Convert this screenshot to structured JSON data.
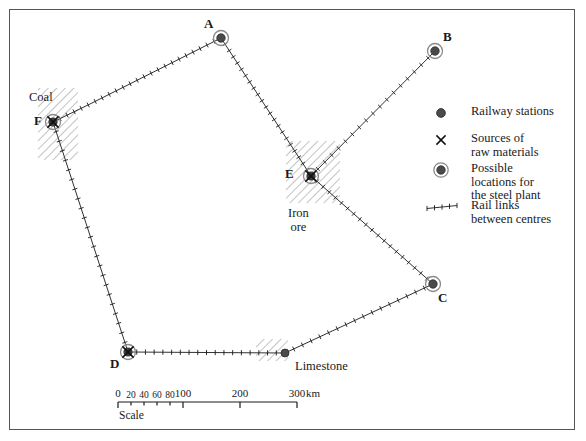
{
  "map": {
    "title": "Railway network map with raw material sources and possible steel plant locations",
    "background_color": "#ffffff",
    "frame_color": "#555555",
    "ink_color": "#1a1a1a",
    "nodes": [
      {
        "id": "A",
        "label": "A",
        "type": "possible-location",
        "x": 221,
        "y": 38,
        "label_dx": -17,
        "label_dy": -21
      },
      {
        "id": "B",
        "label": "B",
        "type": "possible-location",
        "x": 435,
        "y": 51,
        "label_dx": 8,
        "label_dy": -21
      },
      {
        "id": "C",
        "label": "C",
        "type": "possible-location",
        "x": 433,
        "y": 284,
        "label_dx": 5,
        "label_dy": 7
      },
      {
        "id": "D",
        "label": "D",
        "type": "possible-location-source",
        "x": 128,
        "y": 352,
        "label_dx": -18,
        "label_dy": 5
      },
      {
        "id": "E",
        "label": "E",
        "type": "possible-location-source",
        "x": 311,
        "y": 176,
        "label_dx": -26,
        "label_dy": -9
      },
      {
        "id": "F",
        "label": "F",
        "type": "possible-location-source",
        "x": 53,
        "y": 122,
        "label_dx": -19,
        "label_dy": -8
      },
      {
        "id": "LIMESTONE",
        "label": "",
        "type": "railway-station",
        "x": 285,
        "y": 353,
        "label_dx": 0,
        "label_dy": 0
      }
    ],
    "resource_labels": [
      {
        "name": "Coal",
        "text": "Coal",
        "x": 29,
        "y": 91
      },
      {
        "name": "Iron ore",
        "text": "Iron\nore",
        "x": 288,
        "y": 207
      },
      {
        "name": "Limestone",
        "text": "Limestone",
        "x": 295,
        "y": 360
      }
    ],
    "resource_patches": [
      {
        "name": "coal-patch",
        "cx": 58,
        "cy": 124,
        "w": 40,
        "h": 72,
        "angle": 0
      },
      {
        "name": "iron-ore-patch",
        "cx": 313,
        "cy": 172,
        "w": 54,
        "h": 62,
        "angle": 0
      },
      {
        "name": "limestone-patch",
        "cx": 272,
        "cy": 350,
        "w": 32,
        "h": 22,
        "angle": 0
      }
    ],
    "links": [
      {
        "name": "link-F-A",
        "from": "F",
        "to": "A",
        "ticks": 24,
        "bend_x": 88,
        "bend_y": 105
      },
      {
        "name": "link-A-E",
        "from": "A",
        "to": "E",
        "ticks": 22,
        "bend_x": null,
        "bend_y": null
      },
      {
        "name": "link-E-B",
        "from": "E",
        "to": "B",
        "ticks": 18,
        "bend_x": null,
        "bend_y": null
      },
      {
        "name": "link-E-C",
        "from": "E",
        "to": "C",
        "ticks": 20,
        "bend_x": null,
        "bend_y": null
      },
      {
        "name": "link-C-Limestone",
        "from": "C",
        "to": "LIMESTONE",
        "ticks": 17,
        "bend_x": null,
        "bend_y": null
      },
      {
        "name": "link-Limestone-D",
        "from": "LIMESTONE",
        "to": "D",
        "ticks": 18,
        "bend_x": null,
        "bend_y": null
      },
      {
        "name": "link-D-F",
        "from": "D",
        "to": "F",
        "ticks": 24,
        "bend_x": null,
        "bend_y": null
      }
    ]
  },
  "legend": {
    "items": [
      {
        "symbol": "railway-station-symbol",
        "text": "Railway stations"
      },
      {
        "symbol": "source-x-symbol",
        "text": "Sources of\nraw materials"
      },
      {
        "symbol": "possible-location-symbol",
        "text": "Possible\nlocations for\nthe steel plant"
      },
      {
        "symbol": "rail-link-symbol",
        "text": "Rail links\nbetween centres"
      }
    ]
  },
  "scale": {
    "caption": "Scale",
    "unit": "km",
    "ticks": [
      {
        "value": "0",
        "x": 118,
        "minor": false
      },
      {
        "value": "20",
        "x": 131,
        "minor": true
      },
      {
        "value": "40",
        "x": 144,
        "minor": true
      },
      {
        "value": "60",
        "x": 157,
        "minor": true
      },
      {
        "value": "80",
        "x": 170,
        "minor": true
      },
      {
        "value": "100",
        "x": 183,
        "minor": false
      },
      {
        "value": "200",
        "x": 240,
        "minor": false
      },
      {
        "value": "300",
        "x": 297,
        "minor": false
      }
    ],
    "bar_y": 402,
    "bar_x1": 118,
    "bar_x2": 297
  }
}
